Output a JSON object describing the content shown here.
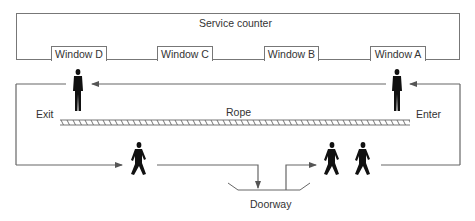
{
  "diagram": {
    "counter": {
      "label": "Service counter"
    },
    "windows": [
      {
        "label": "Window D"
      },
      {
        "label": "Window C"
      },
      {
        "label": "Window B"
      },
      {
        "label": "Window A"
      }
    ],
    "labels": {
      "exit": "Exit",
      "enter": "Enter",
      "rope": "Rope",
      "doorway": "Doorway"
    },
    "figures": [
      {
        "pose": "standing",
        "location": "Window D"
      },
      {
        "pose": "standing",
        "location": "Window A"
      },
      {
        "pose": "walking",
        "location": "bottom-left path"
      },
      {
        "pose": "walking",
        "location": "bottom-right path"
      },
      {
        "pose": "walking",
        "location": "bottom-right path"
      }
    ],
    "colors": {
      "line": "#666666",
      "figure": "#111111",
      "text": "#333333"
    }
  }
}
